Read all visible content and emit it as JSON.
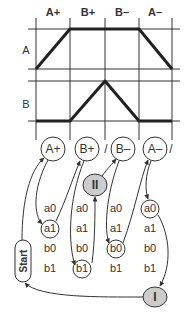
{
  "timing": {
    "columns": [
      "A+",
      "B+",
      "B–",
      "A–"
    ],
    "rows": [
      "A",
      "B"
    ]
  },
  "steps": [
    {
      "label": "A+"
    },
    {
      "label": "B+"
    },
    {
      "label": "B–"
    },
    {
      "label": "A–"
    }
  ],
  "separators": [
    "/",
    "/"
  ],
  "signals": {
    "col1": [
      "a0",
      "a1",
      "b0",
      "b1"
    ],
    "col2": [
      "a0",
      "a1",
      "b0",
      "b1"
    ],
    "col3": [
      "a0",
      "a1",
      "b0",
      "b1"
    ],
    "col4": [
      "a0",
      "a1",
      "b0",
      "b1"
    ]
  },
  "groups": {
    "group1": "I",
    "group2": "II"
  },
  "start_label": "Start"
}
